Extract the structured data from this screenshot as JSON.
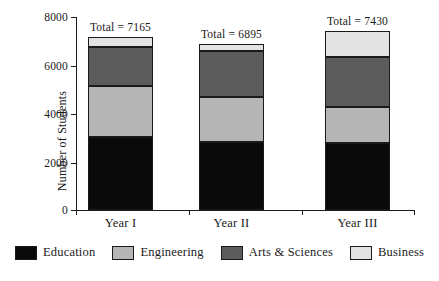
{
  "chart_data": {
    "type": "bar",
    "subtype": "stacked",
    "title": "",
    "xlabel": "",
    "ylabel": "Number of Students",
    "ylim": [
      0,
      8000
    ],
    "yticks": [
      0,
      2000,
      4000,
      6000,
      8000
    ],
    "ytick_labels": [
      "0",
      "2000",
      "4000",
      "6000",
      "8000"
    ],
    "grid": false,
    "legend_position": "bottom",
    "categories": [
      "Year I",
      "Year II",
      "Year III"
    ],
    "series": [
      {
        "name": "Education",
        "color": "#0a0a0a",
        "values": [
          3010,
          2800,
          2760
        ]
      },
      {
        "name": "Engineering",
        "color": "#b5b5b5",
        "values": [
          2145,
          1900,
          1525
        ]
      },
      {
        "name": "Arts & Sciences",
        "color": "#5c5c5c",
        "values": [
          1610,
          1895,
          2060
        ]
      },
      {
        "name": "Business",
        "color": "#e3e3e3",
        "values": [
          400,
          300,
          1085
        ]
      }
    ],
    "totals": [
      7165,
      6895,
      7430
    ],
    "total_labels": [
      "Total = 7165",
      "Total = 6895",
      "Total = 7430"
    ]
  },
  "legend": {
    "items": [
      {
        "label": "Education",
        "color": "#0a0a0a"
      },
      {
        "label": "Engineering",
        "color": "#b5b5b5"
      },
      {
        "label": "Arts & Sciences",
        "color": "#5c5c5c"
      },
      {
        "label": "Business",
        "color": "#e3e3e3"
      }
    ]
  }
}
